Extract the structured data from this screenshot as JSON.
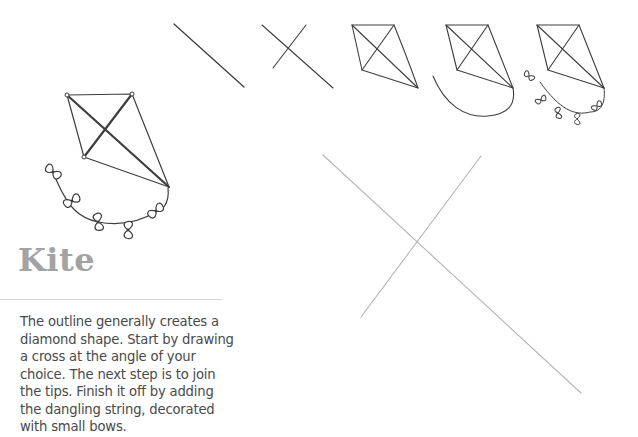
{
  "page": {
    "title": "Kite",
    "description": "The outline generally creates a diamond shape. Start by drawing a cross at the angle of your choice. The next step is to join the tips. Finish it off by adding the dangling string, decorated with small bows."
  },
  "illustrations": {
    "finished_kite": {
      "label": "finished-kite-with-bows"
    },
    "steps": [
      {
        "step": 1,
        "label": "single-diagonal-line"
      },
      {
        "step": 2,
        "label": "cross-lines"
      },
      {
        "step": 3,
        "label": "diamond-outline"
      },
      {
        "step": 4,
        "label": "kite-with-string"
      },
      {
        "step": 5,
        "label": "kite-with-string-and-bows"
      }
    ],
    "large_cross": {
      "label": "large-guide-cross"
    }
  },
  "colors": {
    "title": "#a3a3a3",
    "body_text": "#4a4a4a",
    "divider": "#d6d6d6",
    "pencil": "#3e3e3e",
    "guide": "#b5b5b5"
  }
}
